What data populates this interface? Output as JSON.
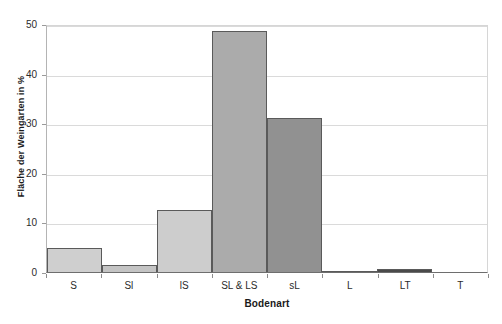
{
  "chart_data": {
    "type": "bar",
    "title": "",
    "title_remnant": "",
    "xlabel": "Bodenart",
    "ylabel": "Fläche der Weingärten in %",
    "categories": [
      "S",
      "Sl",
      "lS",
      "SL & LS",
      "sL",
      "L",
      "LT",
      "T"
    ],
    "values": [
      4.8,
      1.5,
      12.5,
      48.5,
      31.0,
      0.3,
      0.7,
      0.0
    ],
    "bar_colors": [
      "#cfcfcf",
      "#c4c4c4",
      "#cdcdcd",
      "#ababab",
      "#919191",
      "#3a3a3a",
      "#4a4a4a",
      "#ffffff"
    ],
    "bar_edge_color": "#5a5a5a",
    "ylim": [
      0,
      50
    ],
    "yticks": [
      0,
      10,
      20,
      30,
      40,
      50
    ],
    "ytick_labels": [
      "0",
      "10",
      "20",
      "30",
      "40",
      "50"
    ],
    "grid": true,
    "grid_axis": "y",
    "grid_color": "#dadada",
    "legend": false,
    "legend_position": "none",
    "background_color": "#ffffff",
    "axis_color": "#6e6e6e"
  }
}
